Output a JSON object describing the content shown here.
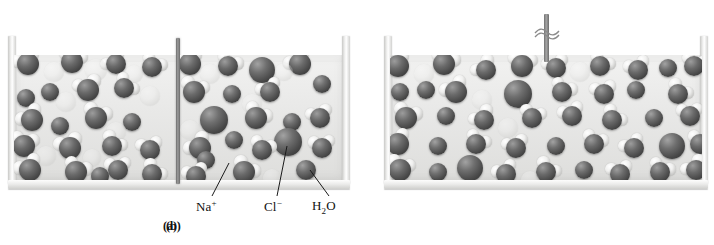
{
  "figure": {
    "type": "scientific-illustration",
    "colors": {
      "ion": "#4a4a4a",
      "oxygen": "#4a4a4a",
      "hydrogen": "#f0f0ef",
      "liquid": "#e9e9e8",
      "glass": "#e3e3e1",
      "divider": "#6e6e6e",
      "background": "#ffffff"
    }
  },
  "panels": [
    {
      "id": "a",
      "caption": "(a)",
      "has_divider": true,
      "has_rod": false
    },
    {
      "id": "b",
      "caption": "(b)",
      "has_divider": false,
      "has_rod": true
    }
  ],
  "legend": [
    {
      "key": "sodium",
      "label_html": "Na<sup>+</sup>",
      "label_text": "Na+",
      "species": "sodium ion"
    },
    {
      "key": "chloride",
      "label_html": "Cl<sup>−</sup>",
      "label_text": "Cl−",
      "species": "chloride ion"
    },
    {
      "key": "water",
      "label_html": "H<sub>2</sub>O",
      "label_text": "H2O",
      "species": "water molecule"
    }
  ],
  "chart_data": {
    "type": "scatter",
    "xlabel": "",
    "ylabel": "",
    "series": [
      {
        "name": "panel-a-left-compartment",
        "particles": [
          {
            "t": "water",
            "x": 28,
            "y": 64,
            "r": 11,
            "a": -25
          },
          {
            "t": "water",
            "x": 72,
            "y": 62,
            "r": 11,
            "a": 15
          },
          {
            "t": "water",
            "x": 116,
            "y": 64,
            "r": 10,
            "a": -40
          },
          {
            "t": "water",
            "x": 152,
            "y": 67,
            "r": 10,
            "a": 30
          },
          {
            "t": "ghost",
            "x": 54,
            "y": 72,
            "r": 10
          },
          {
            "t": "ghost",
            "x": 96,
            "y": 70,
            "r": 11
          },
          {
            "t": "ghost",
            "x": 134,
            "y": 74,
            "r": 9
          },
          {
            "t": "ion",
            "x": 50,
            "y": 92,
            "r": 9,
            "s": "na"
          },
          {
            "t": "water",
            "x": 88,
            "y": 90,
            "r": 11,
            "a": -15
          },
          {
            "t": "water",
            "x": 124,
            "y": 88,
            "r": 10,
            "a": 45
          },
          {
            "t": "ion",
            "x": 26,
            "y": 98,
            "r": 9,
            "s": "na"
          },
          {
            "t": "ghost",
            "x": 66,
            "y": 102,
            "r": 10
          },
          {
            "t": "ghost",
            "x": 150,
            "y": 96,
            "r": 10
          },
          {
            "t": "water",
            "x": 32,
            "y": 120,
            "r": 11,
            "a": -35
          },
          {
            "t": "water",
            "x": 96,
            "y": 118,
            "r": 11,
            "a": 20
          },
          {
            "t": "ion",
            "x": 60,
            "y": 126,
            "r": 9,
            "s": "na"
          },
          {
            "t": "ion",
            "x": 132,
            "y": 122,
            "r": 9,
            "s": "na"
          },
          {
            "t": "ghost",
            "x": 116,
            "y": 132,
            "r": 10
          },
          {
            "t": "water",
            "x": 24,
            "y": 146,
            "r": 11,
            "a": 10
          },
          {
            "t": "water",
            "x": 70,
            "y": 148,
            "r": 11,
            "a": -20
          },
          {
            "t": "water",
            "x": 112,
            "y": 146,
            "r": 10,
            "a": 35
          },
          {
            "t": "water",
            "x": 150,
            "y": 150,
            "r": 10,
            "a": -10
          },
          {
            "t": "ghost",
            "x": 46,
            "y": 156,
            "r": 10
          },
          {
            "t": "ghost",
            "x": 92,
            "y": 158,
            "r": 9
          },
          {
            "t": "water",
            "x": 30,
            "y": 170,
            "r": 11,
            "a": -30
          },
          {
            "t": "water",
            "x": 76,
            "y": 172,
            "r": 11,
            "a": 25
          },
          {
            "t": "water",
            "x": 118,
            "y": 170,
            "r": 10,
            "a": -5
          },
          {
            "t": "ion",
            "x": 100,
            "y": 176,
            "r": 9,
            "s": "na"
          },
          {
            "t": "water",
            "x": 152,
            "y": 174,
            "r": 10,
            "a": 40
          }
        ]
      },
      {
        "name": "panel-a-right-compartment",
        "particles": [
          {
            "t": "water",
            "x": 190,
            "y": 64,
            "r": 11,
            "a": -20
          },
          {
            "t": "water",
            "x": 228,
            "y": 66,
            "r": 10,
            "a": 25
          },
          {
            "t": "ion",
            "x": 262,
            "y": 70,
            "r": 13,
            "s": "cl"
          },
          {
            "t": "water",
            "x": 300,
            "y": 64,
            "r": 11,
            "a": -35
          },
          {
            "t": "ghost",
            "x": 210,
            "y": 74,
            "r": 10
          },
          {
            "t": "ghost",
            "x": 284,
            "y": 72,
            "r": 9
          },
          {
            "t": "water",
            "x": 194,
            "y": 92,
            "r": 11,
            "a": 15
          },
          {
            "t": "ion",
            "x": 232,
            "y": 94,
            "r": 9,
            "s": "na"
          },
          {
            "t": "water",
            "x": 270,
            "y": 92,
            "r": 10,
            "a": -25
          },
          {
            "t": "ion",
            "x": 322,
            "y": 84,
            "r": 9,
            "s": "na"
          },
          {
            "t": "ghost",
            "x": 252,
            "y": 104,
            "r": 10
          },
          {
            "t": "ion",
            "x": 214,
            "y": 120,
            "r": 14,
            "s": "cl"
          },
          {
            "t": "water",
            "x": 256,
            "y": 118,
            "r": 11,
            "a": 30
          },
          {
            "t": "ion",
            "x": 292,
            "y": 122,
            "r": 9,
            "s": "na"
          },
          {
            "t": "water",
            "x": 320,
            "y": 118,
            "r": 10,
            "a": -15
          },
          {
            "t": "ghost",
            "x": 190,
            "y": 130,
            "r": 10
          },
          {
            "t": "ion",
            "x": 234,
            "y": 140,
            "r": 9,
            "s": "na"
          },
          {
            "t": "ion",
            "x": 288,
            "y": 142,
            "r": 14,
            "s": "cl"
          },
          {
            "t": "water",
            "x": 200,
            "y": 148,
            "r": 11,
            "a": -40
          },
          {
            "t": "water",
            "x": 262,
            "y": 150,
            "r": 10,
            "a": 20
          },
          {
            "t": "water",
            "x": 322,
            "y": 148,
            "r": 10,
            "a": -5
          },
          {
            "t": "ion",
            "x": 206,
            "y": 160,
            "r": 9,
            "s": "na"
          },
          {
            "t": "water",
            "x": 244,
            "y": 172,
            "r": 11,
            "a": 35
          },
          {
            "t": "water",
            "x": 196,
            "y": 176,
            "r": 10,
            "a": -18
          },
          {
            "t": "ion",
            "x": 306,
            "y": 170,
            "r": 10,
            "s": "na"
          },
          {
            "t": "ghost",
            "x": 272,
            "y": 178,
            "r": 9
          }
        ]
      },
      {
        "name": "panel-b",
        "particles": [
          {
            "t": "water",
            "x": 398,
            "y": 66,
            "r": 11,
            "a": -25
          },
          {
            "t": "water",
            "x": 444,
            "y": 64,
            "r": 11,
            "a": 20
          },
          {
            "t": "ghost",
            "x": 424,
            "y": 74,
            "r": 10
          },
          {
            "t": "water",
            "x": 486,
            "y": 70,
            "r": 10,
            "a": -40
          },
          {
            "t": "water",
            "x": 522,
            "y": 66,
            "r": 11,
            "a": 10
          },
          {
            "t": "water",
            "x": 556,
            "y": 68,
            "r": 10,
            "a": -15
          },
          {
            "t": "ghost",
            "x": 580,
            "y": 72,
            "r": 10
          },
          {
            "t": "water",
            "x": 600,
            "y": 66,
            "r": 10,
            "a": 30
          },
          {
            "t": "water",
            "x": 638,
            "y": 70,
            "r": 10,
            "a": -20
          },
          {
            "t": "ion",
            "x": 668,
            "y": 68,
            "r": 9,
            "s": "na"
          },
          {
            "t": "water",
            "x": 694,
            "y": 66,
            "r": 10,
            "a": 15
          },
          {
            "t": "ion",
            "x": 400,
            "y": 92,
            "r": 9,
            "s": "na"
          },
          {
            "t": "ion",
            "x": 426,
            "y": 90,
            "r": 9,
            "s": "na"
          },
          {
            "t": "water",
            "x": 456,
            "y": 92,
            "r": 11,
            "a": -30
          },
          {
            "t": "ion",
            "x": 518,
            "y": 94,
            "r": 14,
            "s": "cl"
          },
          {
            "t": "water",
            "x": 562,
            "y": 92,
            "r": 10,
            "a": 25
          },
          {
            "t": "water",
            "x": 604,
            "y": 94,
            "r": 10,
            "a": -10
          },
          {
            "t": "ion",
            "x": 636,
            "y": 90,
            "r": 9,
            "s": "na"
          },
          {
            "t": "water",
            "x": 678,
            "y": 94,
            "r": 10,
            "a": 35
          },
          {
            "t": "ghost",
            "x": 482,
            "y": 100,
            "r": 10
          },
          {
            "t": "water",
            "x": 406,
            "y": 118,
            "r": 11,
            "a": 20
          },
          {
            "t": "ion",
            "x": 446,
            "y": 116,
            "r": 9,
            "s": "na"
          },
          {
            "t": "water",
            "x": 484,
            "y": 120,
            "r": 10,
            "a": -35
          },
          {
            "t": "water",
            "x": 532,
            "y": 118,
            "r": 10,
            "a": 15
          },
          {
            "t": "water",
            "x": 572,
            "y": 116,
            "r": 10,
            "a": -20
          },
          {
            "t": "water",
            "x": 612,
            "y": 120,
            "r": 10,
            "a": 40
          },
          {
            "t": "ion",
            "x": 654,
            "y": 118,
            "r": 9,
            "s": "na"
          },
          {
            "t": "water",
            "x": 690,
            "y": 116,
            "r": 10,
            "a": -5
          },
          {
            "t": "ghost",
            "x": 508,
            "y": 128,
            "r": 10
          },
          {
            "t": "water",
            "x": 398,
            "y": 144,
            "r": 11,
            "a": -25
          },
          {
            "t": "ion",
            "x": 438,
            "y": 146,
            "r": 9,
            "s": "na"
          },
          {
            "t": "water",
            "x": 476,
            "y": 144,
            "r": 10,
            "a": 30
          },
          {
            "t": "water",
            "x": 516,
            "y": 148,
            "r": 10,
            "a": -15
          },
          {
            "t": "ion",
            "x": 556,
            "y": 146,
            "r": 9,
            "s": "na"
          },
          {
            "t": "water",
            "x": 594,
            "y": 144,
            "r": 10,
            "a": 20
          },
          {
            "t": "water",
            "x": 634,
            "y": 148,
            "r": 10,
            "a": -30
          },
          {
            "t": "ion",
            "x": 672,
            "y": 146,
            "r": 13,
            "s": "cl"
          },
          {
            "t": "water",
            "x": 700,
            "y": 144,
            "r": 10,
            "a": 10
          },
          {
            "t": "water",
            "x": 400,
            "y": 170,
            "r": 11,
            "a": 15
          },
          {
            "t": "ion",
            "x": 438,
            "y": 172,
            "r": 9,
            "s": "na"
          },
          {
            "t": "ion",
            "x": 470,
            "y": 168,
            "r": 13,
            "s": "cl"
          },
          {
            "t": "water",
            "x": 506,
            "y": 174,
            "r": 10,
            "a": -25
          },
          {
            "t": "water",
            "x": 546,
            "y": 172,
            "r": 10,
            "a": 35
          },
          {
            "t": "ion",
            "x": 584,
            "y": 170,
            "r": 9,
            "s": "na"
          },
          {
            "t": "water",
            "x": 620,
            "y": 174,
            "r": 10,
            "a": -10
          },
          {
            "t": "water",
            "x": 660,
            "y": 172,
            "r": 10,
            "a": 25
          },
          {
            "t": "water",
            "x": 696,
            "y": 170,
            "r": 10,
            "a": -35
          },
          {
            "t": "ghost",
            "x": 530,
            "y": 180,
            "r": 9
          }
        ]
      }
    ]
  }
}
